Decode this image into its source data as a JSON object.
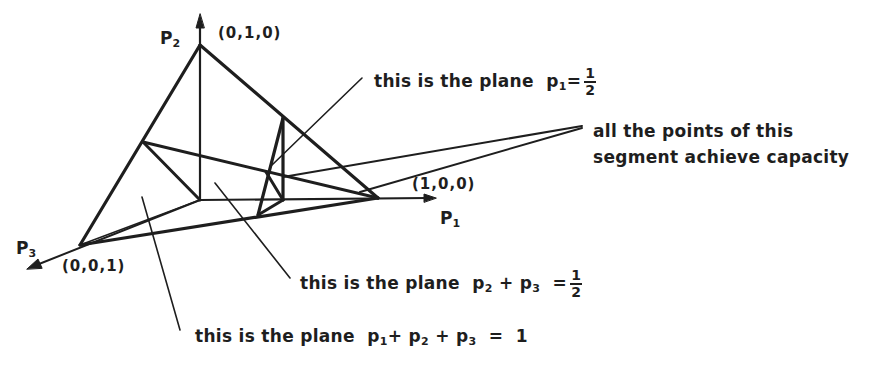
{
  "figure": {
    "axes": {
      "p1": {
        "label": "P",
        "sub": "1"
      },
      "p2": {
        "label": "P",
        "sub": "2"
      },
      "p3": {
        "label": "P",
        "sub": "3"
      }
    },
    "vertices": {
      "v010": "(0,1,0)",
      "v100": "(1,0,0)",
      "v001": "(0,0,1)"
    },
    "annotations": {
      "plane_p1_half": {
        "text": "this is the plane",
        "var": "p",
        "sub": "1",
        "op": "=",
        "num": "1",
        "den": "2"
      },
      "segment_capacity": {
        "line1": "all the points of this",
        "line2": "segment achieve capacity"
      },
      "plane_p2p3_half": {
        "text": "this is the plane",
        "term1": "p",
        "sub1": "2",
        "plus": "+",
        "term2": "p",
        "sub2": "3",
        "op": "=",
        "num": "1",
        "den": "2"
      },
      "plane_sum_one": {
        "text": "this is the plane",
        "term1": "p",
        "sub1": "1",
        "plus1": "+",
        "term2": "p",
        "sub2": "2",
        "plus2": "+",
        "term3": "p",
        "sub3": "3",
        "op": "=",
        "rhs": "1"
      }
    },
    "colors": {
      "ink": "#1e1e1e",
      "paper": "#ffffff"
    }
  }
}
